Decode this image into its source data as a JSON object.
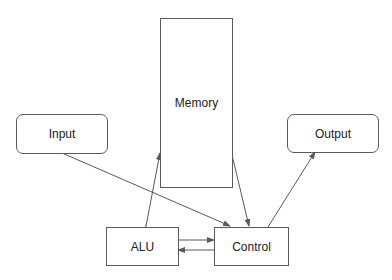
{
  "diagram": {
    "type": "von-neumann-architecture",
    "nodes": {
      "memory": {
        "label": "Memory"
      },
      "input": {
        "label": "Input"
      },
      "output": {
        "label": "Output"
      },
      "alu": {
        "label": "ALU"
      },
      "control": {
        "label": "Control"
      }
    },
    "edges": [
      {
        "from": "input",
        "to": "control",
        "direction": "one-way"
      },
      {
        "from": "memory",
        "to": "alu",
        "direction": "two-way"
      },
      {
        "from": "memory",
        "to": "control",
        "direction": "one-way"
      },
      {
        "from": "control",
        "to": "output",
        "direction": "one-way"
      },
      {
        "from": "alu",
        "to": "control",
        "direction": "one-way"
      },
      {
        "from": "control",
        "to": "alu",
        "direction": "one-way"
      }
    ],
    "colors": {
      "line": "#5a5a5a",
      "text": "#222222",
      "background": "#ffffff"
    }
  }
}
